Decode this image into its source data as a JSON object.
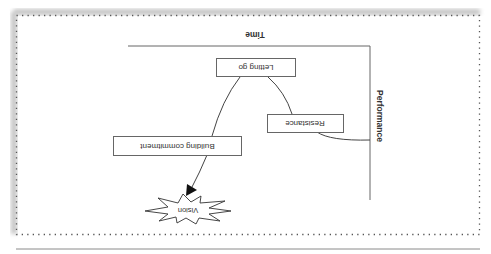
{
  "figure": {
    "orientation": "rotated-180",
    "axes": {
      "x_label": "Time",
      "y_label": "Performance"
    },
    "nodes": [
      {
        "id": "letting-go",
        "label": "Letting go"
      },
      {
        "id": "resistance",
        "label": "Resistance"
      },
      {
        "id": "building-commitment",
        "label": "Building commitment"
      },
      {
        "id": "vision",
        "label": "Vision"
      }
    ],
    "colors": {
      "line": "#444444",
      "frame_dots": "#555555",
      "shadow": "#bdbdbd",
      "text": "#333333"
    }
  }
}
